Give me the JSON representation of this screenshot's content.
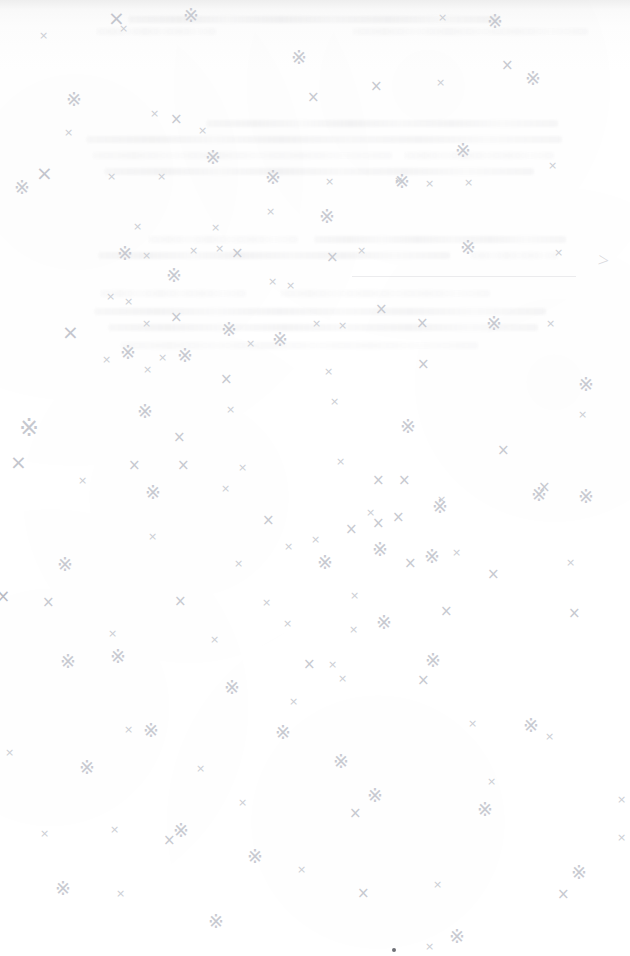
{
  "page": {
    "kind": "scanned-book-page",
    "state_label": "blank page",
    "width": 630,
    "height": 956,
    "background_color": "#ffffff",
    "paper_tone": "#fdfdfd"
  },
  "ghost_text": {
    "description": "illegible bleed-through text from the reverse side of the leaf",
    "legible": false,
    "ink_color": "#8c8c94",
    "region": {
      "top": 0,
      "height": 380
    },
    "lines": [
      {
        "x": 128,
        "y": 16,
        "w": 372,
        "weight": "strong"
      },
      {
        "x": 96,
        "y": 28,
        "w": 120,
        "weight": "faint"
      },
      {
        "x": 352,
        "y": 28,
        "w": 236,
        "weight": "faint"
      },
      {
        "x": 206,
        "y": 120,
        "w": 352,
        "weight": "strong"
      },
      {
        "x": 86,
        "y": 136,
        "w": 476,
        "weight": "strong"
      },
      {
        "x": 92,
        "y": 152,
        "w": 300,
        "weight": "faint"
      },
      {
        "x": 404,
        "y": 152,
        "w": 150,
        "weight": "faint"
      },
      {
        "x": 104,
        "y": 168,
        "w": 430,
        "weight": "strong"
      },
      {
        "x": 148,
        "y": 236,
        "w": 150,
        "weight": "faint"
      },
      {
        "x": 314,
        "y": 236,
        "w": 252,
        "weight": "strong"
      },
      {
        "x": 98,
        "y": 252,
        "w": 352,
        "weight": "strong"
      },
      {
        "x": 470,
        "y": 252,
        "w": 88,
        "weight": "faint"
      },
      {
        "x": 100,
        "y": 290,
        "w": 146,
        "weight": "faint"
      },
      {
        "x": 280,
        "y": 290,
        "w": 210,
        "weight": "faint"
      },
      {
        "x": 94,
        "y": 308,
        "w": 452,
        "weight": "strong"
      },
      {
        "x": 108,
        "y": 324,
        "w": 430,
        "weight": "strong"
      },
      {
        "x": 120,
        "y": 342,
        "w": 358,
        "weight": "faint"
      }
    ],
    "rule": {
      "x": 352,
      "y": 276,
      "w": 224
    },
    "chevron": {
      "glyph": ">",
      "x": 598,
      "y": 250
    }
  },
  "marks": {
    "description": "scattered hand-drawn-looking cross and sparkle marks across the page",
    "glyphs": {
      "cross": "×",
      "sparkle": "※"
    },
    "colors": {
      "cross_small": "#ccced4",
      "cross_medium": "#c7c9d0",
      "cross_large": "#c3c5cd",
      "sparkle": "#c8cad1"
    },
    "items": [
      {
        "t": "x-lg",
        "x": 108,
        "y": 8
      },
      {
        "t": "spark",
        "x": 183,
        "y": 6
      },
      {
        "t": "x-sm",
        "x": 119,
        "y": 23
      },
      {
        "t": "x-sm",
        "x": 39,
        "y": 30
      },
      {
        "t": "x-sm",
        "x": 438,
        "y": 12
      },
      {
        "t": "spark",
        "x": 487,
        "y": 12
      },
      {
        "t": "spark",
        "x": 291,
        "y": 48
      },
      {
        "t": "x-md",
        "x": 370,
        "y": 79
      },
      {
        "t": "x-sm",
        "x": 436,
        "y": 77
      },
      {
        "t": "x-md",
        "x": 501,
        "y": 58
      },
      {
        "t": "spark",
        "x": 525,
        "y": 69
      },
      {
        "t": "spark",
        "x": 66,
        "y": 90
      },
      {
        "t": "x-sm",
        "x": 150,
        "y": 108
      },
      {
        "t": "x-md",
        "x": 170,
        "y": 112
      },
      {
        "t": "x-md",
        "x": 307,
        "y": 90
      },
      {
        "t": "x-sm",
        "x": 64,
        "y": 127
      },
      {
        "t": "x-sm",
        "x": 198,
        "y": 125
      },
      {
        "t": "spark",
        "x": 205,
        "y": 148
      },
      {
        "t": "x-sm",
        "x": 107,
        "y": 171
      },
      {
        "t": "x-sm",
        "x": 157,
        "y": 171
      },
      {
        "t": "spark",
        "x": 265,
        "y": 168
      },
      {
        "t": "spark",
        "x": 455,
        "y": 141
      },
      {
        "t": "x-lg",
        "x": 36,
        "y": 163
      },
      {
        "t": "spark",
        "x": 14,
        "y": 178
      },
      {
        "t": "x-sm",
        "x": 325,
        "y": 176
      },
      {
        "t": "x-sm",
        "x": 394,
        "y": 175
      },
      {
        "t": "spark",
        "x": 394,
        "y": 172
      },
      {
        "t": "x-sm",
        "x": 425,
        "y": 178
      },
      {
        "t": "x-sm",
        "x": 464,
        "y": 177
      },
      {
        "t": "x-sm",
        "x": 548,
        "y": 160
      },
      {
        "t": "x-sm",
        "x": 266,
        "y": 206
      },
      {
        "t": "spark",
        "x": 319,
        "y": 207
      },
      {
        "t": "x-sm",
        "x": 133,
        "y": 221
      },
      {
        "t": "x-sm",
        "x": 211,
        "y": 222
      },
      {
        "t": "spark",
        "x": 117,
        "y": 244
      },
      {
        "t": "x-sm",
        "x": 142,
        "y": 250
      },
      {
        "t": "x-sm",
        "x": 189,
        "y": 245
      },
      {
        "t": "x-sm",
        "x": 215,
        "y": 243
      },
      {
        "t": "x-md",
        "x": 231,
        "y": 246
      },
      {
        "t": "x-md",
        "x": 326,
        "y": 250
      },
      {
        "t": "x-sm",
        "x": 357,
        "y": 245
      },
      {
        "t": "spark",
        "x": 460,
        "y": 238
      },
      {
        "t": "x-sm",
        "x": 554,
        "y": 247
      },
      {
        "t": "spark",
        "x": 166,
        "y": 266
      },
      {
        "t": "x-sm",
        "x": 268,
        "y": 276
      },
      {
        "t": "x-sm",
        "x": 286,
        "y": 280
      },
      {
        "t": "x-md",
        "x": 375,
        "y": 302
      },
      {
        "t": "x-sm",
        "x": 106,
        "y": 291
      },
      {
        "t": "x-sm",
        "x": 124,
        "y": 296
      },
      {
        "t": "x-lg",
        "x": 62,
        "y": 322
      },
      {
        "t": "x-md",
        "x": 170,
        "y": 310
      },
      {
        "t": "spark",
        "x": 221,
        "y": 320
      },
      {
        "t": "spark",
        "x": 272,
        "y": 330
      },
      {
        "t": "x-sm",
        "x": 142,
        "y": 318
      },
      {
        "t": "x-sm",
        "x": 312,
        "y": 318
      },
      {
        "t": "x-sm",
        "x": 338,
        "y": 320
      },
      {
        "t": "x-md",
        "x": 416,
        "y": 316
      },
      {
        "t": "spark",
        "x": 486,
        "y": 314
      },
      {
        "t": "x-sm",
        "x": 546,
        "y": 318
      },
      {
        "t": "x-sm",
        "x": 102,
        "y": 354
      },
      {
        "t": "spark",
        "x": 120,
        "y": 343
      },
      {
        "t": "spark",
        "x": 177,
        "y": 346
      },
      {
        "t": "x-sm",
        "x": 158,
        "y": 352
      },
      {
        "t": "x-sm",
        "x": 143,
        "y": 364
      },
      {
        "t": "x-sm",
        "x": 246,
        "y": 338
      },
      {
        "t": "x-md",
        "x": 220,
        "y": 372
      },
      {
        "t": "x-sm",
        "x": 324,
        "y": 366
      },
      {
        "t": "x-md",
        "x": 417,
        "y": 357
      },
      {
        "t": "spark",
        "x": 578,
        "y": 375
      },
      {
        "t": "spark",
        "x": 137,
        "y": 402
      },
      {
        "t": "x-sm",
        "x": 226,
        "y": 404
      },
      {
        "t": "x-sm",
        "x": 330,
        "y": 396
      },
      {
        "t": "spark",
        "x": 400,
        "y": 417
      },
      {
        "t": "x-sm",
        "x": 578,
        "y": 409
      },
      {
        "t": "spark-lg",
        "x": 19,
        "y": 416
      },
      {
        "t": "x-md",
        "x": 173,
        "y": 430
      },
      {
        "t": "x-md",
        "x": 497,
        "y": 443
      },
      {
        "t": "x-lg",
        "x": 10,
        "y": 452
      },
      {
        "t": "x-md",
        "x": 128,
        "y": 458
      },
      {
        "t": "x-sm",
        "x": 78,
        "y": 475
      },
      {
        "t": "x-md",
        "x": 177,
        "y": 458
      },
      {
        "t": "x-sm",
        "x": 238,
        "y": 462
      },
      {
        "t": "x-sm",
        "x": 336,
        "y": 456
      },
      {
        "t": "x-md",
        "x": 372,
        "y": 473
      },
      {
        "t": "x-md",
        "x": 398,
        "y": 473
      },
      {
        "t": "x-sm",
        "x": 366,
        "y": 507
      },
      {
        "t": "x-md",
        "x": 538,
        "y": 480
      },
      {
        "t": "spark",
        "x": 531,
        "y": 485
      },
      {
        "t": "spark",
        "x": 578,
        "y": 487
      },
      {
        "t": "spark",
        "x": 145,
        "y": 483
      },
      {
        "t": "x-sm",
        "x": 221,
        "y": 483
      },
      {
        "t": "x-sm",
        "x": 437,
        "y": 494
      },
      {
        "t": "spark",
        "x": 432,
        "y": 497
      },
      {
        "t": "x-md",
        "x": 262,
        "y": 513
      },
      {
        "t": "x-md",
        "x": 345,
        "y": 522
      },
      {
        "t": "x-md",
        "x": 372,
        "y": 516
      },
      {
        "t": "x-md",
        "x": 392,
        "y": 510
      },
      {
        "t": "x-sm",
        "x": 311,
        "y": 534
      },
      {
        "t": "spark",
        "x": 372,
        "y": 540
      },
      {
        "t": "x-sm",
        "x": 148,
        "y": 531
      },
      {
        "t": "x-sm",
        "x": 284,
        "y": 541
      },
      {
        "t": "spark",
        "x": 424,
        "y": 547
      },
      {
        "t": "x-sm",
        "x": 452,
        "y": 547
      },
      {
        "t": "spark",
        "x": 57,
        "y": 555
      },
      {
        "t": "x-sm",
        "x": 234,
        "y": 558
      },
      {
        "t": "spark",
        "x": 317,
        "y": 553
      },
      {
        "t": "x-md",
        "x": 404,
        "y": 556
      },
      {
        "t": "x-md",
        "x": 487,
        "y": 567
      },
      {
        "t": "x-sm",
        "x": 566,
        "y": 557
      },
      {
        "t": "x-md",
        "x": 42,
        "y": 595
      },
      {
        "t": "x-md",
        "x": 174,
        "y": 594
      },
      {
        "t": "x-sm",
        "x": 262,
        "y": 597
      },
      {
        "t": "x-sm",
        "x": 350,
        "y": 590
      },
      {
        "t": "x-sm",
        "x": 283,
        "y": 618
      },
      {
        "t": "x-md",
        "x": 568,
        "y": 606
      },
      {
        "t": "x-sm",
        "x": 108,
        "y": 628
      },
      {
        "t": "spark",
        "x": 376,
        "y": 613
      },
      {
        "t": "x-md",
        "x": 440,
        "y": 604
      },
      {
        "t": "x-sm",
        "x": 210,
        "y": 634
      },
      {
        "t": "x-sm",
        "x": 349,
        "y": 624
      },
      {
        "t": "spark",
        "x": 60,
        "y": 652
      },
      {
        "t": "spark",
        "x": 110,
        "y": 647
      },
      {
        "t": "x-md",
        "x": 303,
        "y": 657
      },
      {
        "t": "x-sm",
        "x": 328,
        "y": 659
      },
      {
        "t": "spark",
        "x": 425,
        "y": 651
      },
      {
        "t": "x-sm",
        "x": 338,
        "y": 673
      },
      {
        "t": "spark",
        "x": 224,
        "y": 678
      },
      {
        "t": "x-md",
        "x": 417,
        "y": 673
      },
      {
        "t": "x-sm",
        "x": 289,
        "y": 696
      },
      {
        "t": "x-sm",
        "x": 468,
        "y": 718
      },
      {
        "t": "x-sm",
        "x": 124,
        "y": 724
      },
      {
        "t": "spark",
        "x": 143,
        "y": 721
      },
      {
        "t": "spark",
        "x": 275,
        "y": 723
      },
      {
        "t": "spark",
        "x": 523,
        "y": 716
      },
      {
        "t": "x-sm",
        "x": 545,
        "y": 731
      },
      {
        "t": "x-sm",
        "x": 5,
        "y": 747
      },
      {
        "t": "spark",
        "x": 79,
        "y": 758
      },
      {
        "t": "x-sm",
        "x": 196,
        "y": 763
      },
      {
        "t": "spark",
        "x": 333,
        "y": 752
      },
      {
        "t": "x-sm",
        "x": 487,
        "y": 776
      },
      {
        "t": "x-sm",
        "x": 617,
        "y": 794
      },
      {
        "t": "spark",
        "x": 367,
        "y": 786
      },
      {
        "t": "x-md",
        "x": 349,
        "y": 806
      },
      {
        "t": "x-sm",
        "x": 238,
        "y": 797
      },
      {
        "t": "x-md",
        "x": 163,
        "y": 833
      },
      {
        "t": "spark",
        "x": 173,
        "y": 821
      },
      {
        "t": "x-sm",
        "x": 40,
        "y": 828
      },
      {
        "t": "x-sm",
        "x": 110,
        "y": 824
      },
      {
        "t": "spark",
        "x": 477,
        "y": 800
      },
      {
        "t": "x-sm",
        "x": 617,
        "y": 832
      },
      {
        "t": "spark",
        "x": 247,
        "y": 847
      },
      {
        "t": "x-sm",
        "x": 297,
        "y": 864
      },
      {
        "t": "spark",
        "x": 55,
        "y": 879
      },
      {
        "t": "x-sm",
        "x": 116,
        "y": 888
      },
      {
        "t": "x-md",
        "x": 357,
        "y": 886
      },
      {
        "t": "x-sm",
        "x": 433,
        "y": 879
      },
      {
        "t": "x-md",
        "x": 557,
        "y": 887
      },
      {
        "t": "spark",
        "x": 571,
        "y": 863
      },
      {
        "t": "spark",
        "x": 208,
        "y": 912
      },
      {
        "t": "spark",
        "x": 449,
        "y": 927
      },
      {
        "t": "x-sm",
        "x": 425,
        "y": 941
      }
    ]
  },
  "edge_nick": {
    "glyph": "×",
    "x": -4,
    "y": 588
  },
  "speck": {
    "x": 392,
    "y": 948
  }
}
